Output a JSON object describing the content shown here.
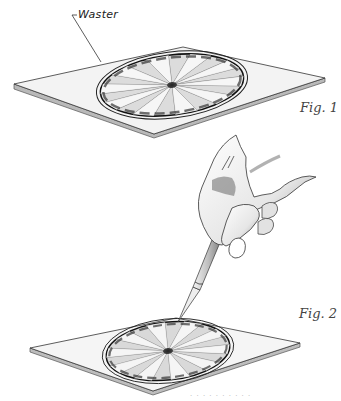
{
  "illustration": {
    "figure1": {
      "label": "Fig. 1",
      "callout": "Waster",
      "subject": "sunburst veneer panel set in waster board",
      "segments": 20
    },
    "figure2": {
      "label": "Fig. 2",
      "subject": "hand holding craft knife cutting sunburst veneer panel",
      "segments": 20
    },
    "colors": {
      "background": "#ffffff",
      "board_top": "#f2f2f2",
      "board_edge": "#9a9a9a",
      "ink": "#222222",
      "shade": "#555555"
    },
    "footer_fragment": "· · · · · · · · · ·"
  }
}
